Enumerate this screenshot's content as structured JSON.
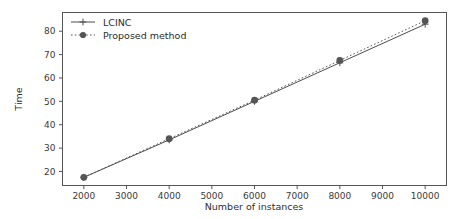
{
  "chart_data": {
    "type": "line",
    "title": "",
    "xlabel": "Number of instances",
    "ylabel": "Time",
    "x": [
      2000,
      4000,
      6000,
      8000,
      10000
    ],
    "xlim": [
      1500,
      10500
    ],
    "ylim": [
      14,
      88
    ],
    "xticks": [
      2000,
      3000,
      4000,
      5000,
      6000,
      7000,
      8000,
      9000,
      10000
    ],
    "xticklabels": [
      "2000",
      "3000",
      "4000",
      "5000",
      "6000",
      "7000",
      "8000",
      "9000",
      "10000"
    ],
    "yticks": [
      20,
      30,
      40,
      50,
      60,
      70,
      80
    ],
    "yticklabels": [
      "20",
      "30",
      "40",
      "50",
      "60",
      "70",
      "80"
    ],
    "grid": false,
    "legend_position": "upper left",
    "series": [
      {
        "name": "LCINC",
        "values": [
          17.5,
          33.5,
          50.0,
          66.5,
          83.0
        ],
        "color": "#4d4d4d",
        "linestyle": "solid",
        "marker": "plus"
      },
      {
        "name": "Proposed method",
        "values": [
          17.5,
          34.0,
          50.5,
          67.5,
          84.5
        ],
        "color": "#555555",
        "linestyle": "dotted",
        "marker": "circle"
      }
    ]
  },
  "legend": {
    "entries": [
      {
        "label": "LCINC"
      },
      {
        "label": "Proposed method"
      }
    ]
  },
  "axes": {
    "xlabel": "Number of instances",
    "ylabel": "Time"
  }
}
